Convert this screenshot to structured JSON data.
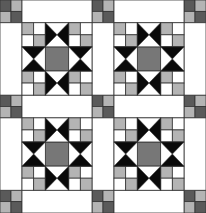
{
  "quilt": {
    "pattern": "ohio-star-with-sashing",
    "width": 206,
    "height": 213,
    "grid": {
      "blocks_x": 2,
      "blocks_y": 2,
      "cornerstone": 22,
      "block": 70
    },
    "colors": {
      "background": "#ffffff",
      "outline": "#333333",
      "star_black": "#0a0a0a",
      "center_gray": "#777777",
      "light_gray": "#b4b4b4",
      "dark_gray": "#5a5a5a",
      "white": "#ffffff"
    },
    "cornerstone_pattern": [
      [
        "dark_gray",
        "light_gray"
      ],
      [
        "light_gray",
        "dark_gray"
      ]
    ],
    "block_corner_pattern": [
      [
        "light_gray",
        "white"
      ],
      [
        "white",
        "light_gray"
      ]
    ],
    "star_point_color": "star_black",
    "center_color": "center_gray"
  }
}
